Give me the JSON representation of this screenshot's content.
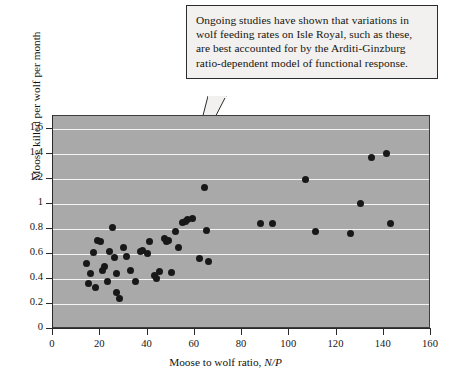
{
  "callout": {
    "text": "Ongoing studies have shown that variations in wolf feeding rates on Isle Royal, such as these, are best accounted for by the Arditi-Ginzburg ratio-dependent model of functional response."
  },
  "chart_data": {
    "type": "scatter",
    "title": "",
    "xlabel": "Moose to wolf ratio, N/P",
    "xlabel_plain": "Moose to wolf ratio,",
    "xlabel_italic": "N/P",
    "ylabel": "Moose killed per wolf per month",
    "xlim": [
      0,
      160
    ],
    "ylim": [
      0,
      1.7
    ],
    "xticks": [
      0,
      20,
      40,
      60,
      80,
      100,
      120,
      140,
      160
    ],
    "xtick_labels": [
      "0",
      "20",
      "40",
      "60",
      "80",
      "100",
      "120",
      "140",
      "160"
    ],
    "yticks": [
      0,
      0.2,
      0.4,
      0.6,
      0.8,
      1,
      1.2,
      1.4,
      1.6
    ],
    "ytick_labels": [
      "0",
      "0.2",
      "0.4",
      "0.6",
      "0.8",
      "1",
      "1.2",
      "1.4",
      "1.6"
    ],
    "grid": "horizontal",
    "gridlines_y": [
      0.2,
      0.4,
      0.6,
      0.8,
      1.0,
      1.2,
      1.4,
      1.6
    ],
    "legend": "none",
    "plot_background": "#a9a9a9",
    "gridline_color": "#f4f4f4",
    "marker_color": "#181818",
    "marker_size": 7,
    "points": [
      {
        "x": 14,
        "y": 0.52
      },
      {
        "x": 15,
        "y": 0.36
      },
      {
        "x": 16,
        "y": 0.44
      },
      {
        "x": 17,
        "y": 0.61
      },
      {
        "x": 18,
        "y": 0.33
      },
      {
        "x": 19,
        "y": 0.71
      },
      {
        "x": 20,
        "y": 0.7
      },
      {
        "x": 21,
        "y": 0.47
      },
      {
        "x": 22,
        "y": 0.5
      },
      {
        "x": 23,
        "y": 0.38
      },
      {
        "x": 24,
        "y": 0.62
      },
      {
        "x": 25,
        "y": 0.81
      },
      {
        "x": 26,
        "y": 0.57
      },
      {
        "x": 27,
        "y": 0.44
      },
      {
        "x": 27,
        "y": 0.29
      },
      {
        "x": 28,
        "y": 0.24
      },
      {
        "x": 30,
        "y": 0.65
      },
      {
        "x": 31,
        "y": 0.58
      },
      {
        "x": 33,
        "y": 0.47
      },
      {
        "x": 35,
        "y": 0.38
      },
      {
        "x": 37,
        "y": 0.62
      },
      {
        "x": 38,
        "y": 0.63
      },
      {
        "x": 40,
        "y": 0.6
      },
      {
        "x": 41,
        "y": 0.7
      },
      {
        "x": 43,
        "y": 0.43
      },
      {
        "x": 44,
        "y": 0.4
      },
      {
        "x": 45,
        "y": 0.46
      },
      {
        "x": 47,
        "y": 0.72
      },
      {
        "x": 48,
        "y": 0.7
      },
      {
        "x": 49,
        "y": 0.71
      },
      {
        "x": 50,
        "y": 0.45
      },
      {
        "x": 52,
        "y": 0.78
      },
      {
        "x": 53,
        "y": 0.65
      },
      {
        "x": 55,
        "y": 0.85
      },
      {
        "x": 56,
        "y": 0.86
      },
      {
        "x": 57,
        "y": 0.87
      },
      {
        "x": 59,
        "y": 0.88
      },
      {
        "x": 62,
        "y": 0.56
      },
      {
        "x": 64,
        "y": 1.13
      },
      {
        "x": 65,
        "y": 0.79
      },
      {
        "x": 66,
        "y": 0.54
      },
      {
        "x": 88,
        "y": 0.84
      },
      {
        "x": 93,
        "y": 0.84
      },
      {
        "x": 107,
        "y": 1.19
      },
      {
        "x": 111,
        "y": 0.78
      },
      {
        "x": 126,
        "y": 0.76
      },
      {
        "x": 130,
        "y": 1.0
      },
      {
        "x": 135,
        "y": 1.37
      },
      {
        "x": 141,
        "y": 1.4
      },
      {
        "x": 143,
        "y": 0.84
      }
    ]
  }
}
